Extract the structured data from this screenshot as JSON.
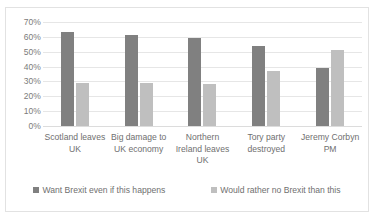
{
  "chart_data": {
    "type": "bar",
    "title": "",
    "subtitle": "",
    "xlabel": "",
    "ylabel": "",
    "categories": [
      "Scotland leaves UK",
      "Big damage to UK economy",
      "Northern Ireland leaves UK",
      "Tory party destroyed",
      "Jeremy Corbyn PM"
    ],
    "series": [
      {
        "name": "Want Brexit even if this happens",
        "color": "#808080",
        "values": [
          63,
          61,
          59,
          54,
          39
        ]
      },
      {
        "name": "Would rather no Brexit than this",
        "color": "#bfbfbf",
        "values": [
          29,
          29,
          28,
          37,
          51
        ]
      }
    ],
    "ylim": [
      0,
      70
    ],
    "ytick_step": 10,
    "ytick_labels": [
      "70%",
      "60%",
      "50%",
      "40%",
      "30%",
      "20%",
      "10%",
      "0%"
    ],
    "ytick_values": [
      70,
      60,
      50,
      40,
      30,
      20,
      10,
      0
    ],
    "grid": true,
    "grid_axis": "y",
    "legend_position": "bottom",
    "border_color": "#e2e2e2",
    "grid_color": "#e6e6e6",
    "text_color": "#6f6f6f"
  }
}
